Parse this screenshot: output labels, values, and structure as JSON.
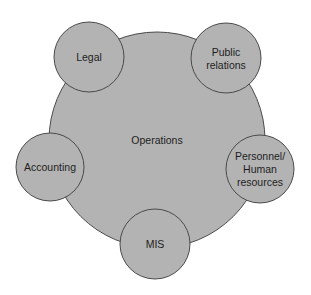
{
  "diagram": {
    "center": {
      "label": "Operations",
      "cx": 157,
      "cy": 140,
      "r": 108
    },
    "satellites": [
      {
        "id": "legal",
        "lines": [
          "Legal"
        ],
        "cx": 89,
        "cy": 57,
        "r": 35
      },
      {
        "id": "public-relations",
        "lines": [
          "Public",
          "relations"
        ],
        "cx": 226,
        "cy": 58,
        "r": 35
      },
      {
        "id": "accounting",
        "lines": [
          "Accounting"
        ],
        "cx": 50,
        "cy": 167,
        "r": 34
      },
      {
        "id": "personnel-human-resources",
        "lines": [
          "Personnel/",
          "Human",
          "resources"
        ],
        "cx": 260,
        "cy": 169,
        "r": 34
      },
      {
        "id": "mis",
        "lines": [
          "MIS"
        ],
        "cx": 155,
        "cy": 244,
        "r": 35
      }
    ],
    "colors": {
      "fill": "#b3b3b3",
      "stroke": "#4a4a4a",
      "text": "#1e1e1e",
      "background": "#ffffff"
    }
  }
}
